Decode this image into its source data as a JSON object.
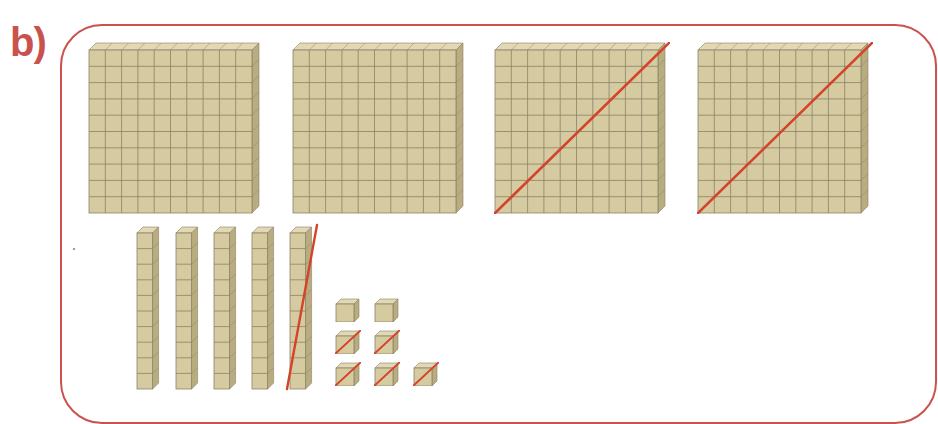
{
  "label": "b)",
  "colors": {
    "frame": "#c9524f",
    "strike": "#d4432c",
    "block_face": "#d6cba0",
    "block_side": "#b9ad80",
    "block_top": "#e2d9b4",
    "grid_line": "#8a8268"
  },
  "blocks": {
    "hundreds": [
      {
        "id": "flat-1",
        "value": 100,
        "crossed_out": false
      },
      {
        "id": "flat-2",
        "value": 100,
        "crossed_out": false
      },
      {
        "id": "flat-3",
        "value": 100,
        "crossed_out": true
      },
      {
        "id": "flat-4",
        "value": 100,
        "crossed_out": true
      }
    ],
    "tens": [
      {
        "id": "rod-1",
        "value": 10,
        "crossed_out": false
      },
      {
        "id": "rod-2",
        "value": 10,
        "crossed_out": false
      },
      {
        "id": "rod-3",
        "value": 10,
        "crossed_out": false
      },
      {
        "id": "rod-4",
        "value": 10,
        "crossed_out": false
      },
      {
        "id": "rod-5",
        "value": 10,
        "crossed_out": true
      }
    ],
    "ones": [
      {
        "id": "unit-1",
        "value": 1,
        "crossed_out": false
      },
      {
        "id": "unit-2",
        "value": 1,
        "crossed_out": false
      },
      {
        "id": "unit-3",
        "value": 1,
        "crossed_out": true
      },
      {
        "id": "unit-4",
        "value": 1,
        "crossed_out": true
      },
      {
        "id": "unit-5",
        "value": 1,
        "crossed_out": true
      },
      {
        "id": "unit-6",
        "value": 1,
        "crossed_out": true
      },
      {
        "id": "unit-7",
        "value": 1,
        "crossed_out": true
      }
    ]
  }
}
